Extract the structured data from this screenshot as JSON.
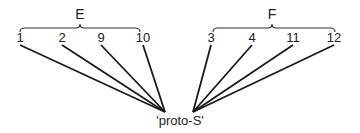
{
  "diagram": {
    "root": {
      "label": "'proto-S'",
      "x": 180,
      "y": 125
    },
    "groups": [
      {
        "label": "E",
        "label_x": 80,
        "label_y": 19,
        "brace": {
          "x1": 20,
          "x2": 140,
          "y": 28
        },
        "converge": {
          "x": 165,
          "y": 112
        },
        "leaves": [
          {
            "label": "1",
            "x": 20,
            "y": 42
          },
          {
            "label": "2",
            "x": 62,
            "y": 42
          },
          {
            "label": "9",
            "x": 101,
            "y": 42
          },
          {
            "label": "10",
            "x": 143,
            "y": 42
          }
        ]
      },
      {
        "label": "F",
        "label_x": 272,
        "label_y": 19,
        "brace": {
          "x1": 213,
          "x2": 335,
          "y": 28
        },
        "converge": {
          "x": 193,
          "y": 112
        },
        "leaves": [
          {
            "label": "3",
            "x": 211,
            "y": 42
          },
          {
            "label": "4",
            "x": 252,
            "y": 42
          },
          {
            "label": "11",
            "x": 293,
            "y": 42
          },
          {
            "label": "12",
            "x": 334,
            "y": 42
          }
        ]
      }
    ]
  }
}
